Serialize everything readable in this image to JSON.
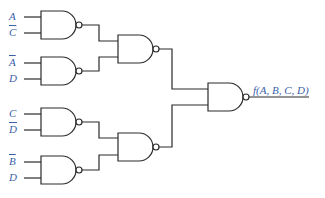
{
  "diagram": {
    "type": "logic-circuit",
    "gate_type": "NAND",
    "colors": {
      "wire": "#2a2a2a",
      "label": "#3b5fa8",
      "background": "#ffffff"
    },
    "inputs": [
      {
        "gate": 1,
        "label": "A",
        "negated": false
      },
      {
        "gate": 1,
        "label": "C",
        "negated": true
      },
      {
        "gate": 2,
        "label": "A",
        "negated": true
      },
      {
        "gate": 2,
        "label": "D",
        "negated": false
      },
      {
        "gate": 3,
        "label": "C",
        "negated": false
      },
      {
        "gate": 3,
        "label": "D",
        "negated": true
      },
      {
        "gate": 4,
        "label": "B",
        "negated": true
      },
      {
        "gate": 4,
        "label": "D",
        "negated": false
      }
    ],
    "output": {
      "label": "f(A, B, C, D)"
    },
    "structure": [
      "NAND1(A, C') -> NAND5",
      "NAND2(A', D) -> NAND5",
      "NAND3(C, D') -> NAND6",
      "NAND4(B', D) -> NAND6",
      "NAND5, NAND6 -> NAND7 -> f(A, B, C, D)"
    ]
  }
}
